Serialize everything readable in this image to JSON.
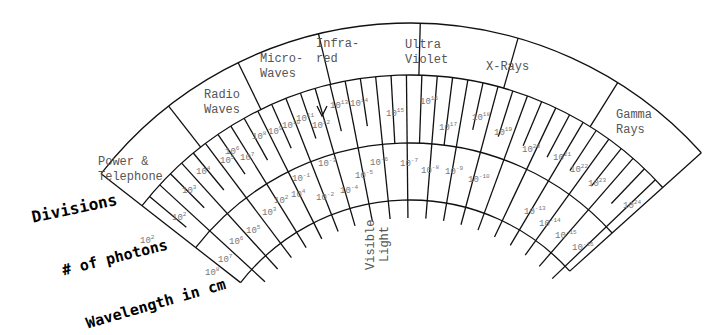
{
  "regions": [
    {
      "label1": "Power &",
      "label2": "Telephone",
      "x": 98,
      "y": 165
    },
    {
      "label1": "Radio",
      "label2": "Waves",
      "x": 204,
      "y": 98
    },
    {
      "label1": "Micro-",
      "label2": "Waves",
      "x": 260,
      "y": 62
    },
    {
      "label1": "Infra-",
      "label2": "red",
      "x": 316,
      "y": 47
    },
    {
      "label1": "Ultra",
      "label2": "Violet",
      "x": 405,
      "y": 48
    },
    {
      "label1": "X-Rays",
      "label2": "",
      "x": 486,
      "y": 70
    },
    {
      "label1": "Gamma",
      "label2": "Rays",
      "x": 616,
      "y": 118
    }
  ],
  "visible_light": {
    "label1": "Visible",
    "label2": "Light"
  },
  "axis_labels": {
    "divisions": "Divisions",
    "photons": "# of photons",
    "wavelength": "Wavelength in cm"
  },
  "photon_values": [
    {
      "exp": "2",
      "x": 140,
      "y": 243
    },
    {
      "exp": "2",
      "x": 172,
      "y": 220
    },
    {
      "exp": "3",
      "x": 182,
      "y": 193
    },
    {
      "exp": "4",
      "x": 196,
      "y": 174
    },
    {
      "exp": "5",
      "x": 220,
      "y": 163
    },
    {
      "exp": "6",
      "x": 225,
      "y": 154
    },
    {
      "exp": "7",
      "x": 240,
      "y": 160
    },
    {
      "exp": "8",
      "x": 252,
      "y": 139
    },
    {
      "exp": "9",
      "x": 268,
      "y": 134
    },
    {
      "exp": "10",
      "x": 282,
      "y": 128
    },
    {
      "exp": "11",
      "x": 296,
      "y": 121
    },
    {
      "exp": "12",
      "x": 312,
      "y": 128
    },
    {
      "exp": "13",
      "x": 330,
      "y": 108
    },
    {
      "exp": "14",
      "x": 350,
      "y": 106
    },
    {
      "exp": "15",
      "x": 386,
      "y": 116
    },
    {
      "exp": "16",
      "x": 420,
      "y": 104
    },
    {
      "exp": "17",
      "x": 439,
      "y": 130
    },
    {
      "exp": "18",
      "x": 472,
      "y": 120
    },
    {
      "exp": "19",
      "x": 494,
      "y": 135
    },
    {
      "exp": "20",
      "x": 522,
      "y": 152
    },
    {
      "exp": "21",
      "x": 553,
      "y": 160
    },
    {
      "exp": "22",
      "x": 570,
      "y": 172
    },
    {
      "exp": "23",
      "x": 588,
      "y": 186
    },
    {
      "exp": "24",
      "x": 623,
      "y": 208
    }
  ],
  "wavelength_values": [
    {
      "exp": "8",
      "x": 205,
      "y": 275
    },
    {
      "exp": "7",
      "x": 218,
      "y": 262
    },
    {
      "exp": "6",
      "x": 229,
      "y": 244
    },
    {
      "exp": "5",
      "x": 246,
      "y": 233
    },
    {
      "exp": "3",
      "x": 262,
      "y": 215
    },
    {
      "exp": "2",
      "x": 274,
      "y": 203
    },
    {
      "exp": "4",
      "x": 291,
      "y": 197
    },
    {
      "exp": "-1",
      "x": 292,
      "y": 181
    },
    {
      "exp": "-2",
      "x": 316,
      "y": 200
    },
    {
      "exp": "-3",
      "x": 318,
      "y": 166
    },
    {
      "exp": "-4",
      "x": 340,
      "y": 193
    },
    {
      "exp": "-5",
      "x": 355,
      "y": 178
    },
    {
      "exp": "-6",
      "x": 370,
      "y": 165
    },
    {
      "exp": "-7",
      "x": 400,
      "y": 166
    },
    {
      "exp": "-8",
      "x": 421,
      "y": 173
    },
    {
      "exp": "-9",
      "x": 445,
      "y": 174
    },
    {
      "exp": "-10",
      "x": 468,
      "y": 182
    },
    {
      "exp": "-13",
      "x": 524,
      "y": 214
    },
    {
      "exp": "-14",
      "x": 539,
      "y": 226
    },
    {
      "exp": "-15",
      "x": 555,
      "y": 238
    },
    {
      "exp": "-16",
      "x": 572,
      "y": 250
    }
  ]
}
